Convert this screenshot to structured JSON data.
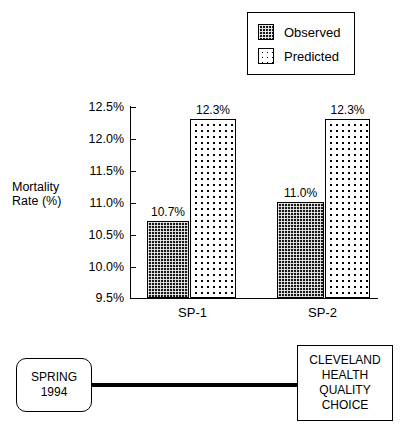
{
  "chart_data": {
    "type": "bar",
    "title": "",
    "xlabel": "",
    "ylabel": "Mortality Rate (%)",
    "ylabel_line1": "Mortality",
    "ylabel_line2": "Rate (%)",
    "categories": [
      "SP-1",
      "SP-2"
    ],
    "series": [
      {
        "name": "Observed",
        "values": [
          10.7,
          12.3
        ],
        "labels": [
          "10.7%",
          "11.0%"
        ]
      },
      {
        "name": "Predicted",
        "values": [
          12.3,
          12.3
        ],
        "labels": [
          "12.3%",
          "12.3%"
        ]
      }
    ],
    "data_points": [
      {
        "category": "SP-1",
        "series": "Observed",
        "value": 10.7,
        "label": "10.7%"
      },
      {
        "category": "SP-1",
        "series": "Predicted",
        "value": 12.3,
        "label": "12.3%"
      },
      {
        "category": "SP-2",
        "series": "Observed",
        "value": 11.0,
        "label": "11.0%"
      },
      {
        "category": "SP-2",
        "series": "Predicted",
        "value": 12.3,
        "label": "12.3%"
      }
    ],
    "ylim": [
      9.5,
      12.5
    ],
    "ytick_labels": [
      "12.5%",
      "12.0%",
      "11.5%",
      "11.0%",
      "10.5%",
      "10.0%",
      "9.5%"
    ],
    "ytick_values": [
      12.5,
      12.0,
      11.5,
      11.0,
      10.5,
      10.0,
      9.5
    ],
    "grid": false,
    "legend_position": "top-right",
    "colors": {
      "observed_fill": "#1a1a1a",
      "predicted_fill": "#ffffff",
      "axis": "#000000",
      "background": "#ffffff"
    }
  },
  "legend": {
    "entries": [
      {
        "label": "Observed",
        "swatch": "dark-hatch-swatch"
      },
      {
        "label": "Predicted",
        "swatch": "dotted-swatch"
      }
    ]
  },
  "footer": {
    "spring_box": {
      "line1": "SPRING",
      "line2": "1994"
    },
    "chqc_box": {
      "line1": "CLEVELAND",
      "line2": "HEALTH",
      "line3": "QUALITY",
      "line4": "CHOICE"
    }
  }
}
